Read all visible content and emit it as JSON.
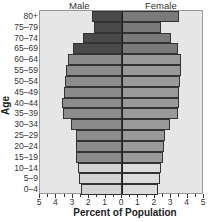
{
  "chart_data": {
    "type": "bar",
    "subtype": "population-pyramid",
    "title": "",
    "xlabel": "Percent of Population",
    "ylabel": "Age",
    "categories": [
      "80+",
      "75–79",
      "70–74",
      "65–69",
      "60–64",
      "55–59",
      "50–54",
      "45–49",
      "40–44",
      "35–39",
      "30–34",
      "25–29",
      "20–24",
      "15–19",
      "10–14",
      "5–9",
      "0–4"
    ],
    "series": [
      {
        "name": "Male",
        "values": [
          1.8,
          1.7,
          2.35,
          3.0,
          3.3,
          3.4,
          3.5,
          3.55,
          3.65,
          3.6,
          3.1,
          2.8,
          2.8,
          2.8,
          2.7,
          2.6,
          2.5
        ]
      },
      {
        "name": "Female",
        "values": [
          3.5,
          2.4,
          3.0,
          3.4,
          3.6,
          3.6,
          3.55,
          3.5,
          3.5,
          3.4,
          2.95,
          2.6,
          2.55,
          2.5,
          2.4,
          2.3,
          2.2
        ]
      }
    ],
    "xlim": [
      -5,
      5
    ],
    "xticks": [
      "5",
      "4",
      "3",
      "2",
      "1",
      "0",
      "1",
      "2",
      "3",
      "4",
      "5"
    ],
    "grid": false,
    "legend": "column headers above plot (Male left, Female right)",
    "colors": {
      "male_old": "#4a4a4a",
      "female_old": "#7a7a7a",
      "male_mid": "#8c8c8c",
      "female_mid": "#9a9a9a",
      "male_young": "#d4d4d4",
      "female_young": "#dcdcdc",
      "background": "#e6e6e6"
    }
  },
  "headers": {
    "male": "Male",
    "female": "Female"
  },
  "axis": {
    "ytitle": "Age",
    "xtitle": "Percent of Population"
  }
}
